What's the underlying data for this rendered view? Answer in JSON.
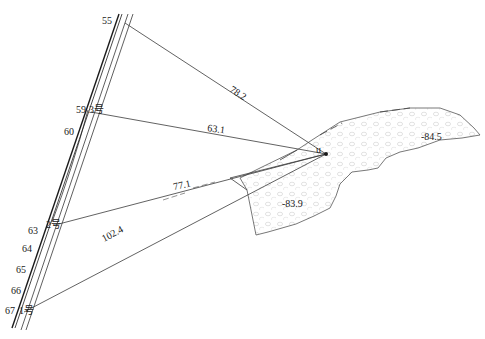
{
  "diagram": {
    "type": "survey-distance-sketch",
    "origin_point_label": "u",
    "road_markers": [
      {
        "label": "55",
        "x": 102,
        "y": 24
      },
      {
        "label": "59",
        "x": 76,
        "y": 113
      },
      {
        "label": "3号",
        "x": 89,
        "y": 113
      },
      {
        "label": "60",
        "x": 64,
        "y": 135
      },
      {
        "label": "2号",
        "x": 48,
        "y": 226
      },
      {
        "label": "63",
        "x": 28,
        "y": 232
      },
      {
        "label": "64",
        "x": 22,
        "y": 250
      },
      {
        "label": "65",
        "x": 16,
        "y": 271
      },
      {
        "label": "66",
        "x": 11,
        "y": 292
      },
      {
        "label": "67",
        "x": 5,
        "y": 312
      },
      {
        "label": "1号",
        "x": 20,
        "y": 312
      }
    ],
    "distances": [
      {
        "label": "78.2",
        "to": "55",
        "x": 229,
        "y": 94,
        "angle": 35
      },
      {
        "label": "63.1",
        "to": "3号",
        "x": 207,
        "y": 131,
        "angle": 7
      },
      {
        "label": "77.1",
        "to": "2号",
        "x": 173,
        "y": 190,
        "angle": -12
      },
      {
        "label": "102.4",
        "to": "1号",
        "x": 104,
        "y": 240,
        "angle": -28
      }
    ],
    "elevations": [
      {
        "label": "-84.5",
        "x": 421,
        "y": 140
      },
      {
        "label": "-83.9",
        "x": 282,
        "y": 207
      }
    ],
    "colors": {
      "line": "#1a1a1a",
      "ray": "#3a3a3a",
      "zone_outline": "#555555",
      "zone_dots": "#c8c8c8"
    }
  }
}
